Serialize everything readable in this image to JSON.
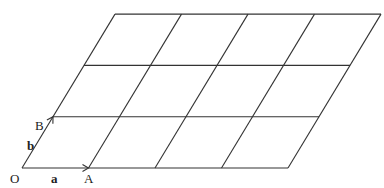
{
  "diagram": {
    "type": "parallelogram-lattice",
    "rows": 3,
    "cols": 4,
    "line_color": "#333333",
    "origin_px": [
      22,
      168
    ],
    "vector_a_px": [
      66.5,
      0
    ],
    "vector_b_px": [
      31,
      -51.3
    ],
    "labels": {
      "origin": "O",
      "point_a": "A",
      "point_b": "B",
      "vector_a": "a",
      "vector_b": "b"
    }
  }
}
